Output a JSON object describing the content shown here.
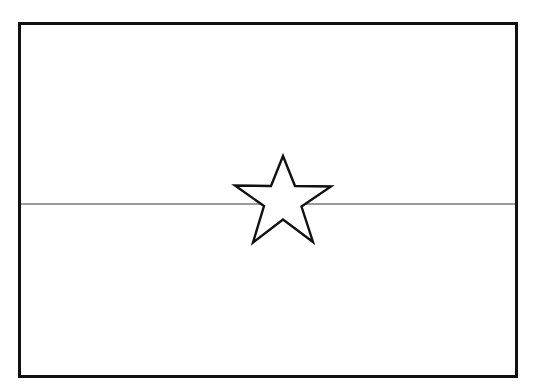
{
  "figure": {
    "title": "Flag outline line drawing",
    "kind": "line-art",
    "background_color": "#ffffff",
    "canvas": {
      "width": 551,
      "height": 392
    }
  },
  "flag": {
    "name": "flag-outline",
    "description": "Rectangular flag outline split into two horizontal bands with a five-pointed star centered on the dividing line",
    "border": {
      "name": "flag-border",
      "color": "#111111",
      "thickness": 3,
      "x": 18,
      "y": 22,
      "width": 500,
      "height": 356
    },
    "bands": [
      {
        "name": "upper-band",
        "label": "Upper band",
        "fill_color": "#ffffff",
        "y_top": 22,
        "y_bottom": 204
      },
      {
        "name": "lower-band",
        "label": "Lower band",
        "fill_color": "#ffffff",
        "y_top": 204,
        "y_bottom": 378
      }
    ],
    "divider": {
      "name": "band-divider-line",
      "label": "Horizontal dividing line",
      "color": "#787878",
      "thickness": 1.4,
      "y": 204,
      "x_start": 19,
      "x_end": 517
    },
    "star": {
      "name": "center-star",
      "label": "Five-pointed star",
      "points": 5,
      "fill_color": "#ffffff",
      "outline_color": "#111111",
      "outline_thickness": 2.4,
      "center_x": 283,
      "center_y": 199,
      "outer_radius": 47,
      "inner_radius": 19,
      "top_tip_y": 157,
      "bottom_tips_y": 242,
      "left_tip_x": 234,
      "right_tip_x": 332,
      "polygon_points": "283,156 295,186 331,186.5 301.5,206.5 313,242 283,219.5 253,242.5 264,206 235,185.5 271,186"
    }
  }
}
